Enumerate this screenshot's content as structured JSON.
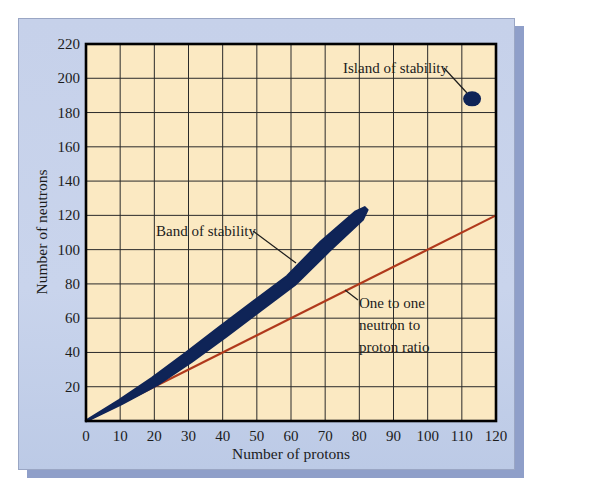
{
  "chart_data": {
    "type": "scatter",
    "title": "",
    "xlabel": "Number of protons",
    "ylabel": "Number of neutrons",
    "xlim": [
      0,
      120
    ],
    "ylim": [
      0,
      220
    ],
    "xticks": [
      0,
      10,
      20,
      30,
      40,
      50,
      60,
      70,
      80,
      90,
      100,
      110,
      120
    ],
    "yticks": [
      20,
      40,
      60,
      80,
      100,
      120,
      140,
      160,
      180,
      200,
      220
    ],
    "grid": true,
    "series": [
      {
        "name": "Band of stability",
        "kind": "band",
        "color": "#0f2457",
        "x": [
          0,
          10,
          20,
          30,
          40,
          50,
          60,
          70,
          80,
          82
        ],
        "y": [
          0,
          11,
          23,
          37,
          52,
          67,
          82,
          102,
          120,
          124
        ]
      },
      {
        "name": "Island of stability",
        "kind": "blob",
        "color": "#0f2457",
        "x": [
          113
        ],
        "y": [
          188
        ]
      },
      {
        "name": "One to one neutron to proton ratio",
        "kind": "line",
        "color": "#b0391c",
        "x": [
          0,
          120
        ],
        "y": [
          0,
          120
        ]
      }
    ],
    "annotations": [
      {
        "text": "Band of stability",
        "x": 20,
        "y": 112
      },
      {
        "text": "Island of stability",
        "x": 92,
        "y": 204
      },
      {
        "text": "One to one",
        "x": 77,
        "y": 68
      },
      {
        "text": "neutron to",
        "x": 77,
        "y": 56
      },
      {
        "text": "proton ratio",
        "x": 77,
        "y": 44
      }
    ],
    "colors": {
      "plot_background": "#fbe9c2",
      "panel_background": "#c8d3eb",
      "grid": "#2a2a2a",
      "band": "#0f2457",
      "ratio_line": "#b0391c"
    }
  },
  "labels": {
    "xlabel": "Number of protons",
    "ylabel": "Number of neutrons",
    "band": "Band of stability",
    "island": "Island of stability",
    "ratio_1": "One to one",
    "ratio_2": "neutron to",
    "ratio_3": "proton ratio"
  }
}
